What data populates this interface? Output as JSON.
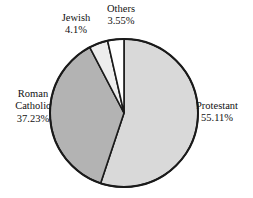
{
  "chart_data": {
    "type": "pie",
    "title": "",
    "categories": [
      "Protestant",
      "Roman Catholic",
      "Jewish",
      "Others"
    ],
    "values": [
      55.11,
      37.23,
      4.1,
      3.55
    ],
    "value_labels": [
      "55.11%",
      "37.23%",
      "4.1%",
      "3.55%"
    ],
    "unit": "%",
    "legend": "none",
    "start_angle_deg": 0,
    "direction": "clockwise",
    "slice_colors": [
      "#d9d9d9",
      "#b3b3b3",
      "#ededed",
      "#ffffff"
    ],
    "stroke_color": "#1a1a1a",
    "background": "#ffffff"
  },
  "labels": {
    "protestant": {
      "name": "Protestant",
      "value": "55.11%"
    },
    "roman_catholic": {
      "name": "Roman\nCatholic",
      "name_line1": "Roman",
      "name_line2": "Catholic",
      "value": "37.23%"
    },
    "jewish": {
      "name": "Jewish",
      "value": "4.1%"
    },
    "others": {
      "name": "Others",
      "value": "3.55%"
    }
  }
}
